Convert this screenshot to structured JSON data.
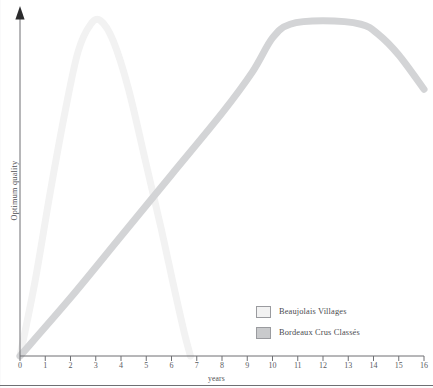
{
  "chart_data": {
    "type": "line",
    "title": "",
    "xlabel": "years",
    "ylabel": "Optimum quality",
    "xlim": [
      0,
      16
    ],
    "ylim": [
      0,
      100
    ],
    "grid": false,
    "legend_position": "bottom-right",
    "x_tick_labels": [
      "0",
      "1",
      "2",
      "3",
      "4",
      "5",
      "6",
      "7",
      "8",
      "9",
      "10",
      "11",
      "12",
      "13",
      "14",
      "15",
      "16"
    ],
    "y_tick_labels": [],
    "series": [
      {
        "name": "Beaujolais Villages",
        "color": "#f2f2f2",
        "points": [
          {
            "x": 0.0,
            "y": 0
          },
          {
            "x": 0.6,
            "y": 22
          },
          {
            "x": 1.2,
            "y": 48
          },
          {
            "x": 1.8,
            "y": 72
          },
          {
            "x": 2.3,
            "y": 89
          },
          {
            "x": 2.8,
            "y": 97
          },
          {
            "x": 3.2,
            "y": 98
          },
          {
            "x": 3.7,
            "y": 92
          },
          {
            "x": 4.3,
            "y": 78
          },
          {
            "x": 5.0,
            "y": 56
          },
          {
            "x": 5.6,
            "y": 37
          },
          {
            "x": 6.1,
            "y": 20
          },
          {
            "x": 6.5,
            "y": 7
          },
          {
            "x": 6.75,
            "y": 0
          }
        ]
      },
      {
        "name": "Bordeaux Crus Classés",
        "color": "#d3d4d6",
        "points": [
          {
            "x": 0.0,
            "y": 0
          },
          {
            "x": 2.0,
            "y": 17
          },
          {
            "x": 4.0,
            "y": 35
          },
          {
            "x": 6.0,
            "y": 53
          },
          {
            "x": 8.0,
            "y": 71
          },
          {
            "x": 9.2,
            "y": 83
          },
          {
            "x": 10.0,
            "y": 93
          },
          {
            "x": 10.7,
            "y": 97
          },
          {
            "x": 12.0,
            "y": 98
          },
          {
            "x": 13.5,
            "y": 97
          },
          {
            "x": 14.2,
            "y": 94
          },
          {
            "x": 15.0,
            "y": 88
          },
          {
            "x": 16.0,
            "y": 78
          }
        ]
      }
    ]
  },
  "axes": {
    "y_axis_title": "Optimum quality",
    "x_axis_title": "years"
  },
  "legend": {
    "items": [
      {
        "label": "Beaujolais Villages",
        "color": "#f2f2f2"
      },
      {
        "label": "Bordeaux Crus Classés",
        "color": "#c9cacc"
      }
    ]
  },
  "colors": {
    "beaujolais": "#f2f2f2",
    "bordeaux": "#d3d4d6",
    "axis": "#6e6f73",
    "text": "#4f5054"
  }
}
